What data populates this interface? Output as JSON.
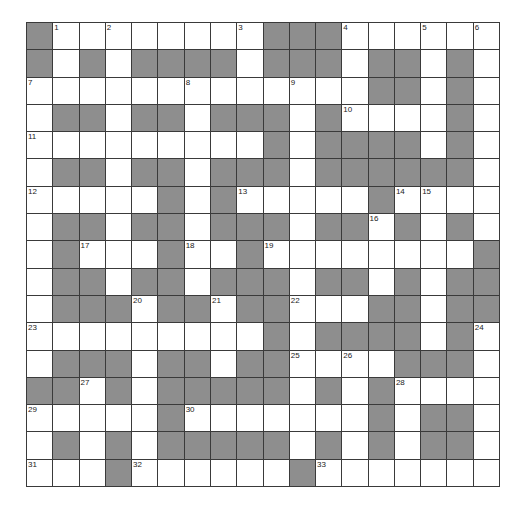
{
  "puzzle": {
    "rows": 17,
    "cols": 18,
    "colors": {
      "block": "#8e8e8e",
      "open": "#ffffff",
      "gridline": "#3a3a3a",
      "number": "#222222"
    },
    "grid": [
      "#........###......",
      "#.#.####.###.##.#.",
      ".............##.#.",
      ".##.##.###.#....#.",
      ".........#.####.#.",
      ".##.##.###.######.",
      ".....#.#.....#....",
      ".##.##.###.##.#.#.",
      ".#...#..#........#",
      ".##.##.###.##.#.##",
      ".###.##.##...##.##",
      ".........#.####.#.",
      ".###.##.##....###.",
      "##.#.#####.#.#....",
      ".....#.......#.##.",
      ".#.#.#####.#.#.##.",
      "...#......#......."
    ],
    "numbers": [
      {
        "n": "1",
        "r": 0,
        "c": 1
      },
      {
        "n": "2",
        "r": 0,
        "c": 3
      },
      {
        "n": "3",
        "r": 0,
        "c": 8
      },
      {
        "n": "4",
        "r": 0,
        "c": 12
      },
      {
        "n": "5",
        "r": 0,
        "c": 15
      },
      {
        "n": "6",
        "r": 0,
        "c": 17
      },
      {
        "n": "7",
        "r": 2,
        "c": 0
      },
      {
        "n": "8",
        "r": 2,
        "c": 6
      },
      {
        "n": "9",
        "r": 2,
        "c": 10
      },
      {
        "n": "10",
        "r": 3,
        "c": 12
      },
      {
        "n": "11",
        "r": 4,
        "c": 0
      },
      {
        "n": "12",
        "r": 6,
        "c": 0
      },
      {
        "n": "13",
        "r": 6,
        "c": 8
      },
      {
        "n": "14",
        "r": 6,
        "c": 14
      },
      {
        "n": "15",
        "r": 6,
        "c": 15
      },
      {
        "n": "16",
        "r": 7,
        "c": 13
      },
      {
        "n": "17",
        "r": 8,
        "c": 2
      },
      {
        "n": "18",
        "r": 8,
        "c": 6
      },
      {
        "n": "19",
        "r": 8,
        "c": 9
      },
      {
        "n": "20",
        "r": 10,
        "c": 4
      },
      {
        "n": "21",
        "r": 10,
        "c": 7
      },
      {
        "n": "22",
        "r": 10,
        "c": 10
      },
      {
        "n": "23",
        "r": 11,
        "c": 0
      },
      {
        "n": "24",
        "r": 11,
        "c": 17
      },
      {
        "n": "25",
        "r": 12,
        "c": 10
      },
      {
        "n": "26",
        "r": 12,
        "c": 12
      },
      {
        "n": "27",
        "r": 13,
        "c": 2
      },
      {
        "n": "28",
        "r": 13,
        "c": 14
      },
      {
        "n": "29",
        "r": 14,
        "c": 0
      },
      {
        "n": "30",
        "r": 14,
        "c": 6
      },
      {
        "n": "31",
        "r": 16,
        "c": 0
      },
      {
        "n": "32",
        "r": 16,
        "c": 4
      },
      {
        "n": "33",
        "r": 16,
        "c": 11
      }
    ]
  }
}
